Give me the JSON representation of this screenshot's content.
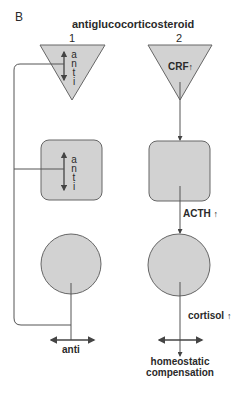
{
  "panel_label": "B",
  "title": "antiglucocorticosteroid",
  "columns": [
    {
      "number": "1"
    },
    {
      "number": "2"
    }
  ],
  "column1": {
    "triangle_text": [
      "a",
      "n",
      "t",
      "i"
    ],
    "square_text": [
      "a",
      "n",
      "t",
      "i"
    ],
    "output_label": "anti"
  },
  "column2": {
    "triangle_label": "CRF",
    "triangle_arrow": "↑",
    "signal1_label": "ACTH",
    "signal1_arrow": "↑",
    "signal2_label": "cortisol",
    "signal2_arrow": "↑",
    "output_label_line1": "homeostatic",
    "output_label_line2": "compensation"
  },
  "colors": {
    "shape_fill": "#d2d2d2",
    "stroke": "#555555",
    "text": "#2a2a2a"
  }
}
